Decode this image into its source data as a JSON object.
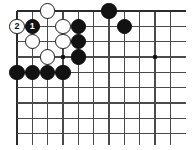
{
  "board": {
    "kind": "go-board-diagram",
    "description": "Go board corner diagram, top-left corner with numbered move sequence",
    "line_color": "#4a4a4a",
    "edge_color": "#2b2b2b",
    "background": "#ffffff",
    "black_color": "#121212",
    "white_color": "#ffffff",
    "origin_x": 17,
    "origin_y": 11,
    "spacing": 15.33,
    "cols": 11,
    "rows": 9,
    "stone_radius": 7.6,
    "hoshi": [
      {
        "col": 3,
        "row": 3
      },
      {
        "col": 9,
        "row": 3
      }
    ],
    "stones": [
      {
        "col": 0,
        "row": 1,
        "color": "white",
        "label": "2"
      },
      {
        "col": 1,
        "row": 1,
        "color": "black",
        "label": "1"
      },
      {
        "col": 2,
        "row": 0,
        "color": "white",
        "label": ""
      },
      {
        "col": 3,
        "row": 1,
        "color": "white",
        "label": ""
      },
      {
        "col": 1,
        "row": 2,
        "color": "white",
        "label": ""
      },
      {
        "col": 3,
        "row": 2,
        "color": "white",
        "label": ""
      },
      {
        "col": 2,
        "row": 3,
        "color": "white",
        "label": ""
      },
      {
        "col": 4,
        "row": 1,
        "color": "black",
        "label": ""
      },
      {
        "col": 4,
        "row": 2,
        "color": "black",
        "label": ""
      },
      {
        "col": 4,
        "row": 3,
        "color": "black",
        "label": ""
      },
      {
        "col": 6,
        "row": 0,
        "color": "black",
        "label": ""
      },
      {
        "col": 7,
        "row": 1,
        "color": "black",
        "label": ""
      },
      {
        "col": 0,
        "row": 4,
        "color": "black",
        "label": ""
      },
      {
        "col": 1,
        "row": 4,
        "color": "black",
        "label": ""
      },
      {
        "col": 2,
        "row": 4,
        "color": "black",
        "label": ""
      },
      {
        "col": 3,
        "row": 4,
        "color": "black",
        "label": ""
      }
    ]
  }
}
